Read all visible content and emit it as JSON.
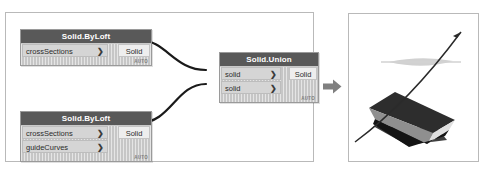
{
  "canvas": {
    "width": 488,
    "height": 171,
    "background": "#ffffff"
  },
  "graph_panel": {
    "name": "dynamo-graph-panel",
    "border_color": "#b9b9b9"
  },
  "nodes": [
    {
      "id": "loft-1",
      "title": "Solid.ByLoft",
      "inputs": [
        {
          "label": "crossSections",
          "chevron": "❯"
        }
      ],
      "outputs": [
        {
          "label": "Solid"
        }
      ],
      "footer": "AUTO"
    },
    {
      "id": "union",
      "title": "Solid.Union",
      "inputs": [
        {
          "label": "solid",
          "chevron": "❯"
        },
        {
          "label": "solid",
          "chevron": "❯"
        }
      ],
      "outputs": [
        {
          "label": "Solid"
        }
      ],
      "footer": "AUTO"
    },
    {
      "id": "loft-2",
      "title": "Solid.ByLoft",
      "inputs": [
        {
          "label": "crossSections",
          "chevron": "❯"
        },
        {
          "label": "guideCurves",
          "chevron": "❯"
        }
      ],
      "outputs": [
        {
          "label": "Solid"
        }
      ],
      "footer": "AUTO"
    }
  ],
  "wires": [
    {
      "from": "loft-1.Solid",
      "to": "union.solid[0]"
    },
    {
      "from": "loft-2.Solid",
      "to": "union.solid[1]"
    }
  ],
  "transition": {
    "name": "result-arrow",
    "direction": "right",
    "color": "#808080"
  },
  "viewport": {
    "name": "3d-preview",
    "border_color": "#b9b9b9",
    "background": "#ffffff",
    "contents": [
      "lofted-solid",
      "guide-curve-line",
      "cross-section-plane"
    ]
  },
  "colors": {
    "node_header": "#595959",
    "node_body": "#c6c6c6",
    "port_input": "#d5d5d5",
    "port_output": "#eeeeee",
    "wire": "#1a1a1a",
    "panel_border": "#b9b9b9",
    "arrow": "#808080",
    "solid_dark": "#2d2d2d",
    "solid_mid": "#8a8a8a",
    "solid_light": "#e3e3e3"
  }
}
